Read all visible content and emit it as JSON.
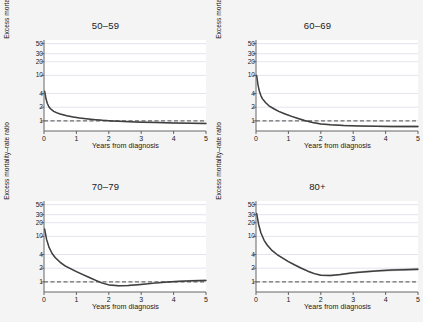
{
  "figure": {
    "background_color": "#f4f4f4",
    "panel_background": "#ffffff",
    "curve_color": "#3f3f3f",
    "ci_color": "#9a9a9a",
    "gridline_color": "#d8d8e4",
    "reference_line_value": 1
  },
  "chart_data": {
    "type": "line",
    "title": "",
    "panels": [
      {
        "title": "50–59",
        "xlabel": "Years from diagnosis",
        "ylabel": "Excess mortality–rate ratio",
        "xlim": [
          0,
          5
        ],
        "ylim": [
          0.6,
          60
        ],
        "yscale": "log",
        "grid": true,
        "xticks": [
          0,
          1,
          2,
          3,
          4,
          5
        ],
        "xticklabels": [
          "0",
          "1",
          "2",
          "3",
          "4",
          "5"
        ],
        "yticks": [
          1,
          2,
          4,
          10,
          20,
          30,
          50
        ],
        "yticklabels": [
          "1",
          "2",
          "4",
          "10",
          "20",
          "30",
          "50"
        ],
        "reference_line": 1,
        "series": [
          {
            "name": "Excess mortality-rate ratio",
            "x": [
              0.02,
              0.06,
              0.1,
              0.15,
              0.2,
              0.3,
              0.4,
              0.5,
              0.7,
              0.9,
              1.1,
              1.3,
              1.5,
              1.8,
              2.1,
              2.5,
              3.0,
              3.5,
              4.0,
              4.5,
              5.0
            ],
            "values": [
              4.5,
              3.1,
              2.45,
              2.05,
              1.85,
              1.62,
              1.5,
              1.42,
              1.3,
              1.22,
              1.16,
              1.12,
              1.08,
              1.03,
              1.0,
              0.97,
              0.94,
              0.92,
              0.9,
              0.89,
              0.88
            ],
            "lower": [
              4.1,
              2.9,
              2.32,
              1.95,
              1.77,
              1.56,
              1.45,
              1.38,
              1.26,
              1.19,
              1.13,
              1.09,
              1.05,
              1.0,
              0.97,
              0.94,
              0.91,
              0.89,
              0.87,
              0.86,
              0.84
            ],
            "upper": [
              4.95,
              3.32,
              2.59,
              2.16,
              1.94,
              1.69,
              1.56,
              1.47,
              1.34,
              1.26,
              1.2,
              1.15,
              1.12,
              1.07,
              1.04,
              1.0,
              0.97,
              0.95,
              0.93,
              0.92,
              0.92
            ]
          }
        ]
      },
      {
        "title": "60–69",
        "xlabel": "Years from diagnosis",
        "ylabel": "Excess mortality–rate ratio",
        "xlim": [
          0,
          5
        ],
        "ylim": [
          0.6,
          60
        ],
        "yscale": "log",
        "grid": true,
        "xticks": [
          0,
          1,
          2,
          3,
          4,
          5
        ],
        "xticklabels": [
          "0",
          "1",
          "2",
          "3",
          "4",
          "5"
        ],
        "yticks": [
          1,
          2,
          4,
          10,
          20,
          30,
          50
        ],
        "yticklabels": [
          "1",
          "2",
          "4",
          "10",
          "20",
          "30",
          "50"
        ],
        "reference_line": 1,
        "series": [
          {
            "name": "Excess mortality-rate ratio",
            "x": [
              0.02,
              0.06,
              0.1,
              0.15,
              0.2,
              0.3,
              0.4,
              0.55,
              0.7,
              0.9,
              1.1,
              1.3,
              1.5,
              1.75,
              2.0,
              2.3,
              2.7,
              3.2,
              3.7,
              4.2,
              4.7,
              5.0
            ],
            "values": [
              10.0,
              6.3,
              4.6,
              3.6,
              3.05,
              2.5,
              2.15,
              1.85,
              1.62,
              1.42,
              1.26,
              1.13,
              1.02,
              0.92,
              0.86,
              0.82,
              0.79,
              0.77,
              0.76,
              0.75,
              0.75,
              0.75
            ],
            "lower": [
              9.1,
              5.9,
              4.35,
              3.42,
              2.9,
              2.39,
              2.06,
              1.78,
              1.56,
              1.37,
              1.22,
              1.09,
              0.98,
              0.89,
              0.83,
              0.79,
              0.76,
              0.74,
              0.73,
              0.72,
              0.71,
              0.71
            ],
            "upper": [
              11.0,
              6.75,
              4.88,
              3.8,
              3.22,
              2.62,
              2.25,
              1.93,
              1.69,
              1.48,
              1.31,
              1.18,
              1.06,
              0.96,
              0.9,
              0.86,
              0.83,
              0.8,
              0.79,
              0.79,
              0.8,
              0.8
            ]
          }
        ]
      },
      {
        "title": "70–79",
        "xlabel": "Years from diagnosis",
        "ylabel": "Excess mortality–rate ratio",
        "xlim": [
          0,
          5
        ],
        "ylim": [
          0.6,
          60
        ],
        "yscale": "log",
        "grid": true,
        "xticks": [
          0,
          1,
          2,
          3,
          4,
          5
        ],
        "xticklabels": [
          "0",
          "1",
          "2",
          "3",
          "4",
          "5"
        ],
        "yticks": [
          1,
          2,
          4,
          10,
          20,
          30,
          50
        ],
        "yticklabels": [
          "1",
          "2",
          "4",
          "10",
          "20",
          "30",
          "50"
        ],
        "reference_line": 1,
        "series": [
          {
            "name": "Excess mortality-rate ratio",
            "x": [
              0.02,
              0.08,
              0.15,
              0.25,
              0.35,
              0.5,
              0.65,
              0.8,
              1.0,
              1.2,
              1.4,
              1.6,
              1.8,
              2.0,
              2.3,
              2.6,
              3.0,
              3.4,
              3.8,
              4.2,
              4.6,
              5.0
            ],
            "values": [
              14.5,
              8.6,
              5.9,
              4.2,
              3.4,
              2.7,
              2.25,
              1.98,
              1.68,
              1.45,
              1.25,
              1.08,
              0.94,
              0.86,
              0.82,
              0.83,
              0.88,
              0.94,
              0.99,
              1.03,
              1.06,
              1.08
            ],
            "lower": [
              13.2,
              8.05,
              5.58,
              3.99,
              3.24,
              2.58,
              2.16,
              1.9,
              1.62,
              1.4,
              1.21,
              1.04,
              0.91,
              0.83,
              0.79,
              0.8,
              0.85,
              0.9,
              0.95,
              0.98,
              1.01,
              1.02
            ],
            "upper": [
              15.9,
              9.2,
              6.25,
              4.42,
              3.57,
              2.83,
              2.35,
              2.07,
              1.75,
              1.51,
              1.3,
              1.12,
              0.98,
              0.9,
              0.86,
              0.87,
              0.92,
              0.98,
              1.04,
              1.08,
              1.12,
              1.15
            ]
          }
        ]
      },
      {
        "title": "80+",
        "xlabel": "Years from diagnosis",
        "ylabel": "Excess mortality–rate ratio",
        "xlim": [
          0,
          5
        ],
        "ylim": [
          0.6,
          60
        ],
        "yscale": "log",
        "grid": true,
        "xticks": [
          0,
          1,
          2,
          3,
          4,
          5
        ],
        "xticklabels": [
          "0",
          "1",
          "2",
          "3",
          "4",
          "5"
        ],
        "yticks": [
          1,
          2,
          4,
          10,
          20,
          30,
          50
        ],
        "yticklabels": [
          "1",
          "2",
          "4",
          "10",
          "20",
          "30",
          "50"
        ],
        "reference_line": 1,
        "series": [
          {
            "name": "Excess mortality-rate ratio",
            "x": [
              0.02,
              0.08,
              0.15,
              0.25,
              0.35,
              0.5,
              0.65,
              0.8,
              1.0,
              1.2,
              1.4,
              1.6,
              1.8,
              2.0,
              2.3,
              2.6,
              3.0,
              3.4,
              3.8,
              4.2,
              4.6,
              5.0
            ],
            "values": [
              32.0,
              18.5,
              12.0,
              8.2,
              6.4,
              4.85,
              4.0,
              3.4,
              2.8,
              2.35,
              2.0,
              1.72,
              1.52,
              1.4,
              1.38,
              1.45,
              1.58,
              1.68,
              1.76,
              1.82,
              1.86,
              1.9
            ],
            "lower": [
              28.5,
              17.2,
              11.3,
              7.8,
              6.1,
              4.64,
              3.83,
              3.26,
              2.69,
              2.26,
              1.92,
              1.65,
              1.46,
              1.34,
              1.32,
              1.39,
              1.51,
              1.6,
              1.67,
              1.72,
              1.75,
              1.76
            ],
            "upper": [
              35.5,
              19.9,
              12.8,
              8.65,
              6.72,
              5.08,
              4.18,
              3.55,
              2.92,
              2.45,
              2.09,
              1.8,
              1.59,
              1.47,
              1.45,
              1.52,
              1.66,
              1.77,
              1.86,
              1.93,
              1.99,
              2.05
            ]
          }
        ]
      }
    ]
  }
}
